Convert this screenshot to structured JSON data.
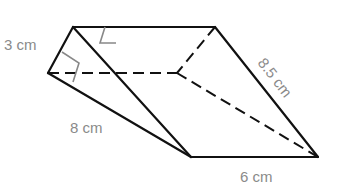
{
  "figure": {
    "type": "triangular prism",
    "labels": {
      "height": "3 cm",
      "slant_edge": "8 cm",
      "hypotenuse_edge": "8.5 cm",
      "base_width": "6 cm"
    },
    "colors": {
      "edge": "#111111",
      "label": "#8a8a8a",
      "right_angle_marker": "#888888"
    }
  }
}
